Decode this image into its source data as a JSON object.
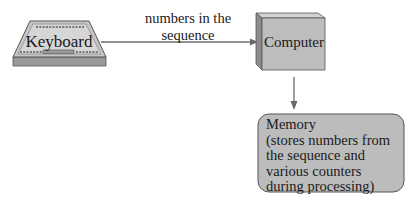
{
  "diagram": {
    "nodes": [
      {
        "id": "keyboard",
        "label": "Keyboard",
        "shape": "keyboard"
      },
      {
        "id": "computer",
        "label": "Computer",
        "shape": "3d-box"
      },
      {
        "id": "memory",
        "label": "Memory",
        "description": "(stores numbers from the sequence and various counters during processing)",
        "shape": "rounded-rect",
        "lines": [
          "Memory",
          "(stores numbers from",
          "the sequence and",
          "various counters",
          "during processing)"
        ]
      }
    ],
    "edges": [
      {
        "from": "keyboard",
        "to": "computer",
        "label_lines": [
          "numbers in the",
          "sequence"
        ]
      },
      {
        "from": "computer",
        "to": "memory",
        "label_lines": []
      }
    ]
  },
  "colors": {
    "fill": "#b9b9b9",
    "fill_light": "#d4d4d4",
    "fill_dark": "#8f8f8f",
    "stroke": "#555555",
    "text": "#1a1a1a",
    "background": "#ffffff"
  }
}
